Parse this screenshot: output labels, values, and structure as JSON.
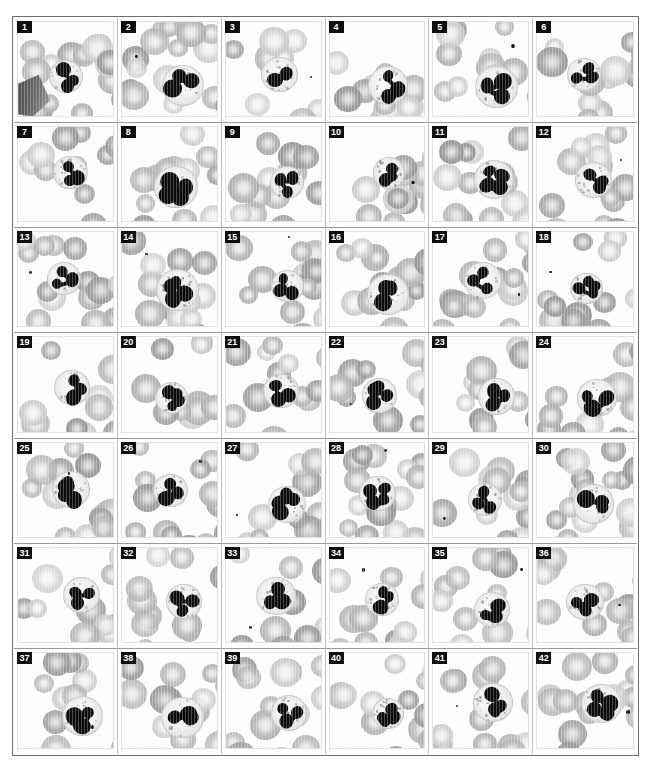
{
  "figure": {
    "title": "",
    "kind": "micrograph-plate",
    "rows": 7,
    "columns": 6,
    "panel_count": 42,
    "colors": {
      "background": "#ffffff",
      "frame": "#6e6e6e",
      "label_background": "#0d0d0d",
      "label_text": "#fdfdfd",
      "nucleus": "#0b0b0b",
      "erythrocyte": "#b3b3b3",
      "cytoplasm": "#f2f2f2"
    }
  },
  "panels": [
    {
      "label": "1",
      "lobes": 3,
      "nucleus": "v-shaped band",
      "variant": "a"
    },
    {
      "label": "2",
      "lobes": 3,
      "nucleus": "c-shaped",
      "variant": "b"
    },
    {
      "label": "3",
      "lobes": 2,
      "nucleus": "bilobed",
      "variant": "c"
    },
    {
      "label": "4",
      "lobes": 3,
      "nucleus": "s-shaped",
      "variant": "d"
    },
    {
      "label": "5",
      "lobes": 3,
      "nucleus": "s-shaped",
      "variant": "e"
    },
    {
      "label": "6",
      "lobes": 3,
      "nucleus": "clustered",
      "variant": "f"
    },
    {
      "label": "7",
      "lobes": 3,
      "nucleus": "clustered",
      "variant": "b"
    },
    {
      "label": "8",
      "lobes": 4,
      "nucleus": "segmented",
      "variant": "c"
    },
    {
      "label": "9",
      "lobes": 3,
      "nucleus": "coiled",
      "variant": "e"
    },
    {
      "label": "10",
      "lobes": 3,
      "nucleus": "separated lobes",
      "variant": "a"
    },
    {
      "label": "11",
      "lobes": 4,
      "nucleus": "segmented",
      "variant": "d"
    },
    {
      "label": "12",
      "lobes": 3,
      "nucleus": "compact",
      "variant": "f"
    },
    {
      "label": "13",
      "lobes": 3,
      "nucleus": "segmented",
      "variant": "b"
    },
    {
      "label": "14",
      "lobes": 4,
      "nucleus": "segmented",
      "variant": "c"
    },
    {
      "label": "15",
      "lobes": 3,
      "nucleus": "s-shaped",
      "variant": "e"
    },
    {
      "label": "16",
      "lobes": 3,
      "nucleus": "segmented",
      "variant": "d"
    },
    {
      "label": "17",
      "lobes": 3,
      "nucleus": "compact",
      "variant": "a"
    },
    {
      "label": "18",
      "lobes": 4,
      "nucleus": "segmented",
      "variant": "f"
    },
    {
      "label": "19",
      "lobes": 3,
      "nucleus": "segmented",
      "variant": "b"
    },
    {
      "label": "20",
      "lobes": 4,
      "nucleus": "segmented",
      "variant": "c"
    },
    {
      "label": "21",
      "lobes": 3,
      "nucleus": "segmented",
      "variant": "e"
    },
    {
      "label": "22",
      "lobes": 4,
      "nucleus": "segmented",
      "variant": "d"
    },
    {
      "label": "23",
      "lobes": 3,
      "nucleus": "c-shaped",
      "variant": "a"
    },
    {
      "label": "24",
      "lobes": 3,
      "nucleus": "compact",
      "variant": "f"
    },
    {
      "label": "25",
      "lobes": 4,
      "nucleus": "segmented",
      "variant": "c"
    },
    {
      "label": "26",
      "lobes": 3,
      "nucleus": "segmented",
      "variant": "b"
    },
    {
      "label": "27",
      "lobes": 4,
      "nucleus": "elongated",
      "variant": "e"
    },
    {
      "label": "28",
      "lobes": 4,
      "nucleus": "segmented",
      "variant": "d"
    },
    {
      "label": "29",
      "lobes": 3,
      "nucleus": "s-shaped",
      "variant": "a"
    },
    {
      "label": "30",
      "lobes": 3,
      "nucleus": "ring-like",
      "variant": "f"
    },
    {
      "label": "31",
      "lobes": 3,
      "nucleus": "segmented",
      "variant": "b"
    },
    {
      "label": "32",
      "lobes": 3,
      "nucleus": "segmented",
      "variant": "c"
    },
    {
      "label": "33",
      "lobes": 3,
      "nucleus": "s-shaped",
      "variant": "d"
    },
    {
      "label": "34",
      "lobes": 4,
      "nucleus": "segmented",
      "variant": "e"
    },
    {
      "label": "35",
      "lobes": 3,
      "nucleus": "segmented",
      "variant": "a"
    },
    {
      "label": "36",
      "lobes": 3,
      "nucleus": "segmented",
      "variant": "f"
    },
    {
      "label": "37",
      "lobes": 3,
      "nucleus": "segmented",
      "variant": "b"
    },
    {
      "label": "38",
      "lobes": 3,
      "nucleus": "segmented",
      "variant": "c"
    },
    {
      "label": "39",
      "lobes": 3,
      "nucleus": "segmented",
      "variant": "e"
    },
    {
      "label": "40",
      "lobes": 4,
      "nucleus": "segmented",
      "variant": "d"
    },
    {
      "label": "41",
      "lobes": 3,
      "nucleus": "segmented",
      "variant": "a"
    },
    {
      "label": "42",
      "lobes": 4,
      "nucleus": "segmented",
      "variant": "f"
    }
  ]
}
